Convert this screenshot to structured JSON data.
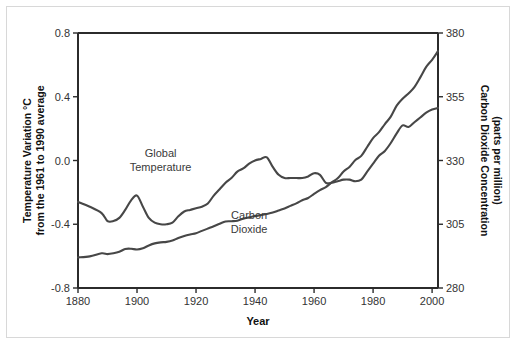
{
  "chart_data": {
    "type": "line",
    "title": "",
    "xlabel": "Year",
    "ylabel_left_line1": "Temperature Variation °C",
    "ylabel_left_line2": "from the 1961 to 1990 average",
    "ylabel_right_line1": "Carbon Dioxide Concentration",
    "ylabel_right_line2": "(parts per million)",
    "xlim": [
      1880,
      2002
    ],
    "xticks": [
      1880,
      1900,
      1920,
      1940,
      1960,
      1980,
      2000
    ],
    "xtick_labels": [
      "1880",
      "1900",
      "1920",
      "1940",
      "1960",
      "1980",
      "2000"
    ],
    "y_left_lim": [
      -0.8,
      0.8
    ],
    "y_left_ticks": [
      -0.8,
      -0.4,
      0.0,
      0.4,
      0.8
    ],
    "y_left_tick_labels": [
      "-0.8",
      "-0.4",
      "0.0",
      "0.4",
      "0.8"
    ],
    "y_right_lim": [
      280,
      380
    ],
    "y_right_ticks": [
      280,
      305,
      330,
      355,
      380
    ],
    "y_right_tick_labels": [
      "280",
      "305",
      "330",
      "355",
      "380"
    ],
    "grid": false,
    "legend_position": "inline-annotations",
    "line_color": "#474747",
    "axis_color": "#2b2b2b",
    "annotations": [
      {
        "name": "global-temperature",
        "line1": "Global",
        "line2": "Temperature",
        "x": 1908,
        "y_left": 0.02
      },
      {
        "name": "carbon-dioxide",
        "line1": "Carbon",
        "line2": "Dioxide",
        "x": 1938,
        "y_left": -0.37
      }
    ],
    "series": [
      {
        "name": "Global Temperature",
        "axis": "left",
        "units": "°C anomaly vs 1961-1990",
        "x": [
          1880,
          1884,
          1888,
          1890,
          1892,
          1894,
          1896,
          1898,
          1900,
          1902,
          1904,
          1906,
          1908,
          1910,
          1912,
          1914,
          1916,
          1918,
          1920,
          1922,
          1924,
          1926,
          1928,
          1930,
          1932,
          1934,
          1936,
          1938,
          1940,
          1942,
          1944,
          1946,
          1948,
          1950,
          1952,
          1954,
          1956,
          1958,
          1960,
          1962,
          1964,
          1966,
          1968,
          1970,
          1972,
          1974,
          1976,
          1978,
          1980,
          1982,
          1984,
          1986,
          1988,
          1990,
          1992,
          1994,
          1996,
          1998,
          2000,
          2002
        ],
        "values": [
          -0.26,
          -0.29,
          -0.33,
          -0.38,
          -0.38,
          -0.36,
          -0.31,
          -0.25,
          -0.22,
          -0.29,
          -0.36,
          -0.39,
          -0.4,
          -0.4,
          -0.39,
          -0.35,
          -0.32,
          -0.31,
          -0.3,
          -0.29,
          -0.27,
          -0.22,
          -0.18,
          -0.14,
          -0.11,
          -0.07,
          -0.05,
          -0.02,
          0.0,
          0.01,
          0.02,
          -0.04,
          -0.09,
          -0.11,
          -0.11,
          -0.11,
          -0.11,
          -0.1,
          -0.08,
          -0.09,
          -0.14,
          -0.14,
          -0.13,
          -0.12,
          -0.12,
          -0.13,
          -0.12,
          -0.07,
          -0.02,
          0.03,
          0.06,
          0.11,
          0.17,
          0.22,
          0.21,
          0.24,
          0.27,
          0.3,
          0.32,
          0.33
        ]
      },
      {
        "name": "Carbon Dioxide",
        "axis": "right",
        "units": "ppm",
        "x": [
          1880,
          1884,
          1888,
          1890,
          1892,
          1894,
          1896,
          1898,
          1900,
          1902,
          1904,
          1906,
          1908,
          1910,
          1912,
          1914,
          1916,
          1918,
          1920,
          1922,
          1924,
          1926,
          1928,
          1930,
          1932,
          1934,
          1936,
          1938,
          1940,
          1942,
          1944,
          1946,
          1948,
          1950,
          1952,
          1954,
          1956,
          1958,
          1960,
          1962,
          1964,
          1966,
          1968,
          1970,
          1972,
          1974,
          1976,
          1978,
          1980,
          1982,
          1984,
          1986,
          1988,
          1990,
          1992,
          1994,
          1996,
          1998,
          2000,
          2002
        ],
        "values": [
          292.0,
          292.4,
          293.6,
          293.3,
          293.6,
          294.2,
          295.3,
          295.4,
          295.1,
          295.6,
          296.7,
          297.5,
          297.9,
          298.1,
          298.6,
          299.6,
          300.4,
          301.0,
          301.5,
          302.4,
          303.3,
          304.2,
          305.2,
          306.1,
          306.2,
          306.4,
          307.2,
          307.7,
          308.2,
          308.6,
          309.0,
          309.6,
          310.4,
          311.2,
          312.2,
          313.2,
          314.4,
          315.3,
          316.9,
          318.4,
          319.6,
          321.4,
          323.0,
          325.7,
          327.5,
          330.2,
          331.8,
          335.3,
          338.8,
          341.1,
          344.3,
          347.2,
          351.5,
          354.2,
          356.3,
          358.8,
          362.6,
          366.7,
          369.5,
          372.9
        ]
      }
    ]
  }
}
